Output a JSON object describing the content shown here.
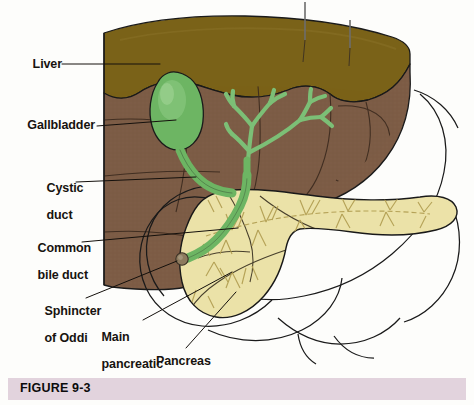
{
  "figure": {
    "caption": "FIGURE 9-3",
    "caption_bar_color": "#e2d3dd",
    "background_color": "#fdfdfb"
  },
  "labels": [
    {
      "id": "liver",
      "text": "Liver",
      "lines": [
        "Liver"
      ]
    },
    {
      "id": "gallbladder",
      "text": "Gallbladder",
      "lines": [
        "Gallbladder"
      ]
    },
    {
      "id": "cystic-duct",
      "text": "Cystic duct",
      "lines": [
        "Cystic",
        "duct"
      ]
    },
    {
      "id": "common-bile-duct",
      "text": "Common bile duct",
      "lines": [
        "Common",
        "bile duct"
      ]
    },
    {
      "id": "sphincter-of-oddi",
      "text": "Sphincter of Oddi",
      "lines": [
        "Sphincter",
        "of Oddi"
      ]
    },
    {
      "id": "main-pancreatic-duct",
      "text": "Main pancreatic duct",
      "lines": [
        "Main",
        "pancreatic",
        "duct"
      ]
    },
    {
      "id": "pancreas",
      "text": "Pancreas",
      "lines": [
        "Pancreas"
      ]
    }
  ],
  "structures": {
    "liver_top_surface": "#7a6218",
    "liver_cut_face": "#7d5c45",
    "liver_cut_face_light": "#8a6752",
    "gallbladder": "#6db563",
    "bile_duct": "#7cbf76",
    "pancreas": "#ece2a8",
    "pancreas_duct_line": "#b39f53",
    "sphincter_of_oddi": "#8d7a5e",
    "duodenum_outline": "#ffffff",
    "outline_stroke": "#1a1a1a"
  },
  "leader_lines": {
    "stroke": "#14100c",
    "stroke_width": 1.0
  },
  "unlabeled_pointers": {
    "count": 2,
    "color": "#6d6d6d",
    "note": "two thin vertical pointer lines at top of liver"
  }
}
